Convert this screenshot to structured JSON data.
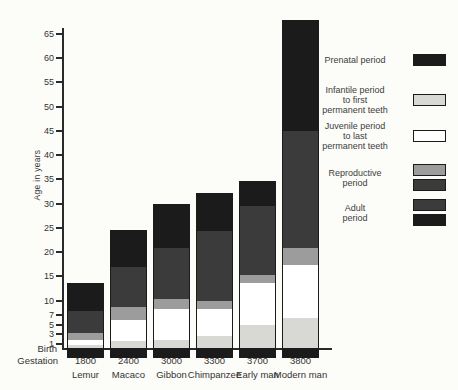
{
  "colors": {
    "black": "#1b1b1b",
    "dark": "#3b3b3b",
    "medium": "#9c9c9c",
    "light": "#d8d8d5",
    "white": "#ffffff",
    "background": "#fcfcf9",
    "text": "#333333"
  },
  "chart": {
    "y_axis": {
      "label": "Age in years",
      "birth_label": "Birth",
      "gestation_label": "Gestation"
    }
  },
  "chart_data": {
    "type": "bar",
    "stacked": true,
    "title": "",
    "xlabel": "",
    "ylabel": "Age in years",
    "ylim": [
      0,
      68
    ],
    "yticks": [
      65,
      60,
      55,
      50,
      45,
      40,
      35,
      30,
      25,
      20,
      15,
      10,
      7,
      5,
      3,
      1
    ],
    "grid": false,
    "legend_position": "right",
    "categories": [
      "Lemur",
      "Macaco",
      "Gibbon",
      "Chimpanzee",
      "Early man",
      "Modern man"
    ],
    "gestation_row": {
      "label": "Gestation",
      "values": [
        "1800",
        "2400",
        "3000",
        "3300",
        "3700",
        "3800"
      ]
    },
    "birth_line_label": "Birth",
    "prenatal": {
      "name": "Prenatal period",
      "color_key": "black",
      "drawn_below_birth_line": true
    },
    "series": [
      {
        "key": "infantile",
        "name": "Infantile period to first permanent teeth",
        "color_key": "light",
        "cumulative_end": [
          0.6,
          1.4,
          1.7,
          2.6,
          4.9,
          6.2
        ]
      },
      {
        "key": "juvenile",
        "name": "Juvenile period to last permanent teeth",
        "color_key": "white",
        "cumulative_end": [
          1.8,
          5.9,
          8.2,
          8.2,
          13.5,
          17.3
        ]
      },
      {
        "key": "repro-band",
        "name": "Reproductive period (light onset band)",
        "color_key": "medium",
        "cumulative_end": [
          3.2,
          8.7,
          10.2,
          9.9,
          15.3,
          20.8
        ]
      },
      {
        "key": "repro",
        "name": "Reproductive period",
        "color_key": "dark",
        "cumulative_end": [
          7.8,
          17.0,
          21.0,
          24.5,
          29.7,
          45.0
        ]
      },
      {
        "key": "adult",
        "name": "Adult period",
        "color_key": "black",
        "cumulative_end": [
          13.7,
          24.5,
          30.0,
          32.2,
          34.6,
          67.8
        ]
      }
    ]
  },
  "legend": {
    "items": [
      {
        "key": "prenatal",
        "label_lines": [
          "Prenatal period"
        ],
        "swatches": [
          "black"
        ]
      },
      {
        "key": "infantile",
        "label_lines": [
          "Infantile period",
          "to first",
          "permanent teeth"
        ],
        "swatches": [
          "light"
        ]
      },
      {
        "key": "juvenile",
        "label_lines": [
          "Juvenile period",
          "to last",
          "permanent teeth"
        ],
        "swatches": [
          "white"
        ]
      },
      {
        "key": "reproductive",
        "label_lines": [
          "Reproductive",
          "period"
        ],
        "swatches": [
          "medium",
          "dark"
        ]
      },
      {
        "key": "adult",
        "label_lines": [
          "Adult",
          "period"
        ],
        "swatches": [
          "dark",
          "black"
        ]
      }
    ]
  }
}
